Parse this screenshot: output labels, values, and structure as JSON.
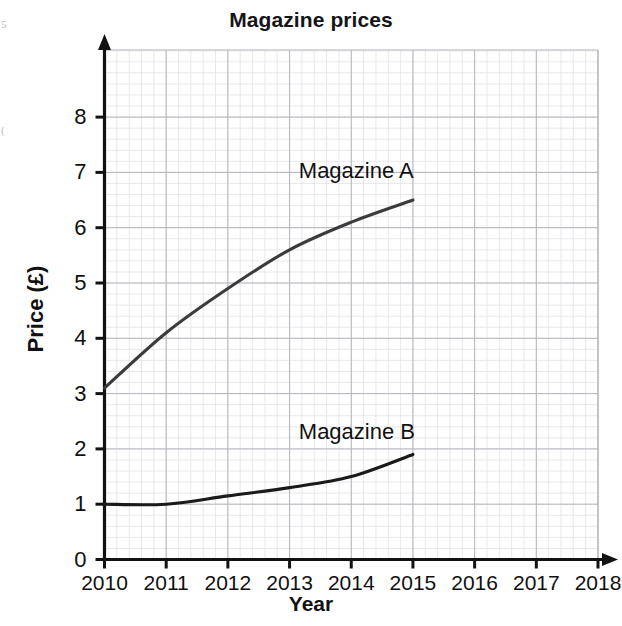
{
  "chart_data": {
    "type": "line",
    "title": "Magazine prices",
    "xlabel": "Year",
    "ylabel": "Price (£)",
    "x": [
      2010,
      2011,
      2012,
      2013,
      2014,
      2015,
      2016,
      2017,
      2018
    ],
    "xlim": [
      2010,
      2018
    ],
    "ylim": [
      0,
      8.8
    ],
    "grid": true,
    "minor_grid": true,
    "legend": "inline-annotation",
    "xticks": [
      "2010",
      "2011",
      "2012",
      "2013",
      "2014",
      "2015",
      "2016",
      "2017",
      "2018"
    ],
    "yticks": [
      "0",
      "1",
      "2",
      "3",
      "4",
      "5",
      "6",
      "7",
      "8"
    ],
    "series": [
      {
        "name": "Magazine A",
        "color": "#3b3b3b",
        "x": [
          2010,
          2011,
          2012,
          2013,
          2014,
          2015
        ],
        "values": [
          3.1,
          4.1,
          4.9,
          5.6,
          6.1,
          6.5
        ],
        "label_x": 2013.15,
        "label_y": 7.0
      },
      {
        "name": "Magazine B",
        "color": "#1a1a1a",
        "x": [
          2010,
          2011,
          2012,
          2013,
          2014,
          2015
        ],
        "values": [
          1.0,
          1.0,
          1.15,
          1.3,
          1.5,
          1.9
        ],
        "label_x": 2013.15,
        "label_y": 2.28
      }
    ]
  },
  "annotations": {
    "series_a_label": "Magazine A",
    "series_b_label": "Magazine B"
  },
  "scan_marks": {
    "top_left": "5",
    "mid_left": "("
  }
}
